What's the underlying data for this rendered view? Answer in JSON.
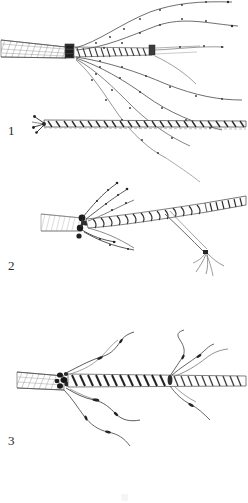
{
  "plate": {
    "type": "scientific-illustration-plate",
    "medium": "ink line drawing, monochrome halftone scan",
    "background_color": "#ffffff",
    "ink_color": "#2b2b2b",
    "light_ink_color": "#8a8a8a",
    "width": 248,
    "height": 503,
    "figure_count": 3
  },
  "figures": [
    {
      "id": "figure-1",
      "label": "1",
      "label_x": 8,
      "label_y": 124,
      "description": "Upper specimen: a hatched leaf-sheath at left terminating at a dark swollen node, from which a striated main axis continues right to a second smaller node; seven slender beaded filaments radiate upward-right and downward-right. Below it a separate detached twisted stem segment with a small dark basal cluster.",
      "parts": [
        {
          "name": "leaf-sheath",
          "style": "diagonal hatch",
          "x1": 2,
          "y1": 38,
          "x2": 66,
          "y2": 58
        },
        {
          "name": "primary-node",
          "style": "dark swollen collar",
          "cx": 68,
          "cy": 52
        },
        {
          "name": "main-axis",
          "style": "striated cylinder",
          "x1": 68,
          "y1": 52,
          "x2": 152,
          "y2": 50
        },
        {
          "name": "secondary-node",
          "style": "small dark collar",
          "cx": 152,
          "cy": 50
        },
        {
          "name": "ascending-filaments",
          "count": 3
        },
        {
          "name": "descending-filaments",
          "count": 4
        },
        {
          "name": "detached-stem-segment",
          "x1": 40,
          "y1": 124,
          "x2": 246,
          "y2": 122
        },
        {
          "name": "basal-cluster",
          "cx": 44,
          "cy": 124
        }
      ]
    },
    {
      "id": "figure-2",
      "label": "2",
      "label_x": 8,
      "label_y": 259,
      "description": "Middle specimen: a pale hatched sheath at left, a dense dark node bearing several short beaded appendages pointing up-left and down, a coarsely spiralled main axis running right and slightly upward, and a slender branch descending to the lower right that ends in a tuft of fine rootlets.",
      "parts": [
        {
          "name": "leaf-sheath",
          "style": "fine hatch",
          "x1": 42,
          "y1": 216,
          "x2": 80,
          "y2": 230
        },
        {
          "name": "node-cluster",
          "style": "dark knot with appendages",
          "cx": 82,
          "cy": 222
        },
        {
          "name": "spiral-axis",
          "style": "helical banding",
          "x1": 82,
          "y1": 222,
          "x2": 222,
          "y2": 204
        },
        {
          "name": "ascending-appendages",
          "count": 3
        },
        {
          "name": "descending-appendages",
          "count": 3
        },
        {
          "name": "descending-branch",
          "x1": 160,
          "y1": 215,
          "x2": 208,
          "y2": 255
        },
        {
          "name": "terminal-rootlet-tuft",
          "cx": 210,
          "cy": 258
        }
      ]
    },
    {
      "id": "figure-3",
      "label": "3",
      "label_x": 8,
      "label_y": 434,
      "description": "Lower specimen: a broad hatched sheath at left, a dark congested node, a long obliquely banded main axis extending to the right edge, with long sinuous wavy filaments emerging upward and downward from the node and from a second point midway along the axis.",
      "parts": [
        {
          "name": "leaf-sheath",
          "style": "diagonal hatch",
          "x1": 18,
          "y1": 374,
          "x2": 60,
          "y2": 388
        },
        {
          "name": "node-cluster",
          "style": "dark congested knot",
          "cx": 64,
          "cy": 382
        },
        {
          "name": "main-axis",
          "style": "oblique banding",
          "x1": 64,
          "y1": 382,
          "x2": 246,
          "y2": 382
        },
        {
          "name": "mid-axis-branch-point",
          "cx": 170,
          "cy": 380
        },
        {
          "name": "ascending-wavy-filaments",
          "count": 4
        },
        {
          "name": "descending-wavy-filaments",
          "count": 4
        }
      ]
    }
  ],
  "caption_fragment": {
    "visible": true,
    "text": "░",
    "note": "top edge of a cut-off caption glyph at bottom centre"
  }
}
